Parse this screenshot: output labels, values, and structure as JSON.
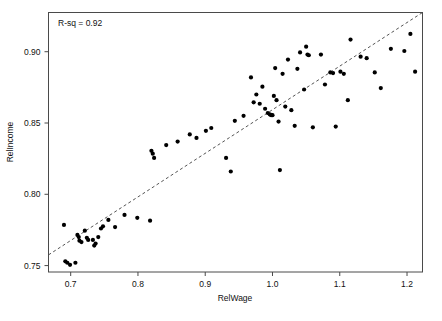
{
  "figure": {
    "annotation": "R-sq =  0.92",
    "background": "#ffffff",
    "point_color": "#000000",
    "line_color": "#555555",
    "frame_color": "#4a4a4a"
  },
  "axes": {
    "x_title": "RelWage",
    "y_title": "RelIncome",
    "x_ticks": [
      "0.7",
      "0.8",
      "0.9",
      "1.0",
      "1.1",
      "1.2"
    ],
    "y_ticks": [
      "0.75",
      "0.80",
      "0.85",
      "0.90"
    ]
  },
  "chart_data": {
    "type": "scatter",
    "title": "",
    "xlabel": "RelWage",
    "ylabel": "RelIncome",
    "xlim": [
      0.667,
      1.223
    ],
    "ylim": [
      0.7455,
      0.9275
    ],
    "xticks": [
      0.7,
      0.8,
      0.9,
      1.0,
      1.1,
      1.2
    ],
    "yticks": [
      0.75,
      0.8,
      0.85,
      0.9
    ],
    "grid": false,
    "legend": null,
    "annotations": [
      {
        "text": "R-sq =  0.92",
        "x": 0.695,
        "y": 0.9205,
        "align": "left"
      }
    ],
    "fit_line": {
      "style": "dashed",
      "r_squared": 0.92,
      "x": [
        0.667,
        1.223
      ],
      "y": [
        0.7575,
        0.9275
      ]
    },
    "points": [
      {
        "x": 0.69,
        "y": 0.7785
      },
      {
        "x": 0.692,
        "y": 0.753
      },
      {
        "x": 0.695,
        "y": 0.752
      },
      {
        "x": 0.699,
        "y": 0.7505
      },
      {
        "x": 0.707,
        "y": 0.752
      },
      {
        "x": 0.71,
        "y": 0.7715
      },
      {
        "x": 0.712,
        "y": 0.77
      },
      {
        "x": 0.713,
        "y": 0.7675
      },
      {
        "x": 0.716,
        "y": 0.7665
      },
      {
        "x": 0.721,
        "y": 0.7745
      },
      {
        "x": 0.724,
        "y": 0.7695
      },
      {
        "x": 0.726,
        "y": 0.768
      },
      {
        "x": 0.733,
        "y": 0.768
      },
      {
        "x": 0.735,
        "y": 0.764
      },
      {
        "x": 0.737,
        "y": 0.7655
      },
      {
        "x": 0.741,
        "y": 0.77
      },
      {
        "x": 0.745,
        "y": 0.776
      },
      {
        "x": 0.748,
        "y": 0.7775
      },
      {
        "x": 0.756,
        "y": 0.782
      },
      {
        "x": 0.766,
        "y": 0.777
      },
      {
        "x": 0.78,
        "y": 0.7855
      },
      {
        "x": 0.799,
        "y": 0.7835
      },
      {
        "x": 0.818,
        "y": 0.7815
      },
      {
        "x": 0.82,
        "y": 0.8305
      },
      {
        "x": 0.822,
        "y": 0.8285
      },
      {
        "x": 0.824,
        "y": 0.8255
      },
      {
        "x": 0.842,
        "y": 0.8345
      },
      {
        "x": 0.859,
        "y": 0.837
      },
      {
        "x": 0.877,
        "y": 0.842
      },
      {
        "x": 0.887,
        "y": 0.8395
      },
      {
        "x": 0.901,
        "y": 0.8445
      },
      {
        "x": 0.909,
        "y": 0.8465
      },
      {
        "x": 0.931,
        "y": 0.8255
      },
      {
        "x": 0.938,
        "y": 0.816
      },
      {
        "x": 0.944,
        "y": 0.8515
      },
      {
        "x": 0.957,
        "y": 0.855
      },
      {
        "x": 0.968,
        "y": 0.882
      },
      {
        "x": 0.972,
        "y": 0.8645
      },
      {
        "x": 0.976,
        "y": 0.87
      },
      {
        "x": 0.981,
        "y": 0.8635
      },
      {
        "x": 0.985,
        "y": 0.8755
      },
      {
        "x": 0.989,
        "y": 0.86
      },
      {
        "x": 0.993,
        "y": 0.857
      },
      {
        "x": 0.996,
        "y": 0.856
      },
      {
        "x": 0.998,
        "y": 0.8555
      },
      {
        "x": 1.0,
        "y": 0.8555
      },
      {
        "x": 1.002,
        "y": 0.869
      },
      {
        "x": 1.004,
        "y": 0.8885
      },
      {
        "x": 1.006,
        "y": 0.866
      },
      {
        "x": 1.009,
        "y": 0.851
      },
      {
        "x": 1.011,
        "y": 0.817
      },
      {
        "x": 1.015,
        "y": 0.8845
      },
      {
        "x": 1.019,
        "y": 0.8615
      },
      {
        "x": 1.023,
        "y": 0.8945
      },
      {
        "x": 1.028,
        "y": 0.859
      },
      {
        "x": 1.033,
        "y": 0.848
      },
      {
        "x": 1.037,
        "y": 0.888
      },
      {
        "x": 1.041,
        "y": 0.8995
      },
      {
        "x": 1.047,
        "y": 0.8735
      },
      {
        "x": 1.05,
        "y": 0.9035
      },
      {
        "x": 1.052,
        "y": 0.898
      },
      {
        "x": 1.054,
        "y": 0.8975
      },
      {
        "x": 1.06,
        "y": 0.847
      },
      {
        "x": 1.072,
        "y": 0.898
      },
      {
        "x": 1.078,
        "y": 0.877
      },
      {
        "x": 1.086,
        "y": 0.8855
      },
      {
        "x": 1.09,
        "y": 0.885
      },
      {
        "x": 1.094,
        "y": 0.8475
      },
      {
        "x": 1.101,
        "y": 0.886
      },
      {
        "x": 1.106,
        "y": 0.8845
      },
      {
        "x": 1.112,
        "y": 0.866
      },
      {
        "x": 1.116,
        "y": 0.9085
      },
      {
        "x": 1.131,
        "y": 0.8965
      },
      {
        "x": 1.14,
        "y": 0.8955
      },
      {
        "x": 1.152,
        "y": 0.8855
      },
      {
        "x": 1.161,
        "y": 0.8745
      },
      {
        "x": 1.176,
        "y": 0.902
      },
      {
        "x": 1.196,
        "y": 0.9005
      },
      {
        "x": 1.205,
        "y": 0.9125
      },
      {
        "x": 1.212,
        "y": 0.886
      }
    ]
  }
}
